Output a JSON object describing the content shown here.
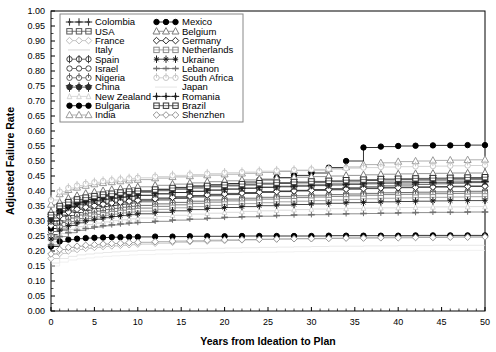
{
  "chart_data": {
    "type": "line",
    "title": "",
    "xlabel": "Years from Ideation to Plan",
    "ylabel": "Adjusted Failure Rate",
    "xlim": [
      0,
      50
    ],
    "ylim": [
      0.0,
      1.0
    ],
    "xticks": [
      0,
      5,
      10,
      15,
      20,
      25,
      30,
      35,
      40,
      45,
      50
    ],
    "yticks": [
      0.0,
      0.05,
      0.1,
      0.15,
      0.2,
      0.25,
      0.3,
      0.35,
      0.4,
      0.45,
      0.5,
      0.55,
      0.6,
      0.65,
      0.7,
      0.75,
      0.8,
      0.85,
      0.9,
      0.95,
      1.0
    ],
    "ytick_labels": [
      "0.00",
      "0.05",
      "0.10",
      "0.15",
      "0.20",
      "0.25",
      "0.30",
      "0.35",
      "0.40",
      "0.45",
      "0.50",
      "0.55",
      "0.60",
      "0.65",
      "0.70",
      "0.75",
      "0.80",
      "0.85",
      "0.90",
      "0.95",
      "1.00"
    ],
    "xtick_labels": [
      "0",
      "5",
      "10",
      "15",
      "20",
      "25",
      "30",
      "35",
      "40",
      "45",
      "50"
    ],
    "grid": false,
    "legend_position": "top-left",
    "marker_step_interval": 2,
    "x": [
      0,
      1,
      2,
      3,
      4,
      5,
      6,
      7,
      8,
      9,
      10,
      12,
      14,
      16,
      18,
      20,
      22,
      24,
      26,
      28,
      30,
      32,
      34,
      36,
      38,
      40,
      42,
      44,
      46,
      48,
      50
    ],
    "series": [
      {
        "name": "Colombia",
        "marker": "star4",
        "color": "#3a3a3a",
        "fill": "solid",
        "values": [
          0.255,
          0.3,
          0.318,
          0.328,
          0.336,
          0.342,
          0.348,
          0.352,
          0.356,
          0.36,
          0.364,
          0.37,
          0.375,
          0.38,
          0.384,
          0.388,
          0.392,
          0.396,
          0.399,
          0.402,
          0.405,
          0.408,
          0.411,
          0.414,
          0.417,
          0.42,
          0.422,
          0.424,
          0.426,
          0.428,
          0.43
        ]
      },
      {
        "name": "USA",
        "marker": "square-grid",
        "color": "#555555",
        "fill": "open",
        "values": [
          0.3,
          0.33,
          0.345,
          0.354,
          0.36,
          0.366,
          0.371,
          0.375,
          0.379,
          0.382,
          0.385,
          0.39,
          0.395,
          0.399,
          0.403,
          0.407,
          0.41,
          0.413,
          0.416,
          0.419,
          0.422,
          0.424,
          0.426,
          0.428,
          0.43,
          0.432,
          0.434,
          0.436,
          0.437,
          0.438,
          0.44
        ]
      },
      {
        "name": "France",
        "marker": "diamond",
        "color": "#bbbbbb",
        "fill": "open",
        "values": [
          0.175,
          0.192,
          0.2,
          0.205,
          0.209,
          0.212,
          0.215,
          0.217,
          0.219,
          0.221,
          0.223,
          0.226,
          0.229,
          0.231,
          0.233,
          0.235,
          0.237,
          0.239,
          0.24,
          0.241,
          0.242,
          0.243,
          0.244,
          0.245,
          0.246,
          0.247,
          0.248,
          0.248,
          0.249,
          0.249,
          0.25
        ]
      },
      {
        "name": "Italy",
        "marker": "none",
        "color": "#e2e2e2",
        "fill": "open",
        "values": [
          0.16,
          0.175,
          0.182,
          0.187,
          0.19,
          0.193,
          0.195,
          0.197,
          0.199,
          0.2,
          0.202,
          0.204,
          0.206,
          0.208,
          0.209,
          0.21,
          0.211,
          0.212,
          0.213,
          0.214,
          0.215,
          0.216,
          0.216,
          0.217,
          0.217,
          0.218,
          0.218,
          0.219,
          0.219,
          0.219,
          0.22
        ]
      },
      {
        "name": "Spain",
        "marker": "circle-plus",
        "color": "#404040",
        "fill": "open",
        "values": [
          0.29,
          0.32,
          0.334,
          0.343,
          0.35,
          0.355,
          0.359,
          0.363,
          0.366,
          0.369,
          0.372,
          0.377,
          0.381,
          0.385,
          0.389,
          0.392,
          0.395,
          0.398,
          0.4,
          0.402,
          0.404,
          0.406,
          0.408,
          0.41,
          0.412,
          0.413,
          0.414,
          0.415,
          0.416,
          0.417,
          0.418
        ]
      },
      {
        "name": "Israel",
        "marker": "circle",
        "color": "#4a4a4a",
        "fill": "open",
        "values": [
          0.265,
          0.295,
          0.31,
          0.32,
          0.327,
          0.333,
          0.338,
          0.342,
          0.346,
          0.349,
          0.352,
          0.357,
          0.362,
          0.366,
          0.37,
          0.373,
          0.376,
          0.379,
          0.382,
          0.384,
          0.386,
          0.388,
          0.39,
          0.392,
          0.394,
          0.395,
          0.396,
          0.397,
          0.398,
          0.399,
          0.4
        ]
      },
      {
        "name": "Nigeria",
        "marker": "circle-bar",
        "color": "#606060",
        "fill": "open",
        "values": [
          0.25,
          0.282,
          0.298,
          0.308,
          0.316,
          0.322,
          0.327,
          0.332,
          0.336,
          0.34,
          0.343,
          0.349,
          0.354,
          0.359,
          0.363,
          0.367,
          0.37,
          0.373,
          0.376,
          0.378,
          0.38,
          0.382,
          0.384,
          0.386,
          0.388,
          0.389,
          0.39,
          0.391,
          0.392,
          0.393,
          0.394
        ]
      },
      {
        "name": "China",
        "marker": "circle-cross",
        "color": "#2d2d2d",
        "fill": "solid",
        "values": [
          0.31,
          0.342,
          0.357,
          0.366,
          0.373,
          0.378,
          0.383,
          0.387,
          0.39,
          0.393,
          0.396,
          0.401,
          0.406,
          0.41,
          0.414,
          0.417,
          0.42,
          0.423,
          0.425,
          0.427,
          0.429,
          0.431,
          0.433,
          0.435,
          0.437,
          0.438,
          0.439,
          0.44,
          0.441,
          0.442,
          0.443
        ]
      },
      {
        "name": "New Zealand",
        "marker": "tri-small",
        "color": "#cfcfcf",
        "fill": "open",
        "values": [
          0.23,
          0.258,
          0.272,
          0.281,
          0.288,
          0.293,
          0.297,
          0.301,
          0.304,
          0.307,
          0.31,
          0.315,
          0.319,
          0.323,
          0.326,
          0.329,
          0.332,
          0.334,
          0.336,
          0.338,
          0.34,
          0.341,
          0.342,
          0.343,
          0.344,
          0.345,
          0.346,
          0.347,
          0.347,
          0.348,
          0.348
        ]
      },
      {
        "name": "Bulgaria",
        "marker": "circle",
        "color": "#000000",
        "fill": "solid",
        "values": [
          0.215,
          0.232,
          0.238,
          0.241,
          0.243,
          0.244,
          0.245,
          0.246,
          0.246,
          0.247,
          0.247,
          0.248,
          0.248,
          0.249,
          0.249,
          0.249,
          0.25,
          0.25,
          0.25,
          0.25,
          0.25,
          0.251,
          0.251,
          0.251,
          0.251,
          0.251,
          0.252,
          0.252,
          0.252,
          0.252,
          0.252
        ]
      },
      {
        "name": "India",
        "marker": "triangle",
        "color": "#9a9a9a",
        "fill": "open",
        "values": [
          0.355,
          0.39,
          0.404,
          0.412,
          0.418,
          0.423,
          0.427,
          0.43,
          0.433,
          0.436,
          0.438,
          0.443,
          0.447,
          0.45,
          0.453,
          0.456,
          0.459,
          0.462,
          0.465,
          0.468,
          0.47,
          0.474,
          0.48,
          0.488,
          0.494,
          0.498,
          0.5,
          0.502,
          0.503,
          0.504,
          0.505
        ]
      },
      {
        "name": "Mexico",
        "marker": "circle",
        "color": "#000000",
        "fill": "solid",
        "values": [
          0.275,
          0.33,
          0.35,
          0.362,
          0.371,
          0.378,
          0.384,
          0.389,
          0.393,
          0.397,
          0.4,
          0.406,
          0.412,
          0.417,
          0.421,
          0.425,
          0.43,
          0.437,
          0.445,
          0.452,
          0.46,
          0.478,
          0.5,
          0.545,
          0.548,
          0.55,
          0.551,
          0.552,
          0.552,
          0.553,
          0.553
        ]
      },
      {
        "name": "Belgium",
        "marker": "triangle",
        "color": "#7a7a7a",
        "fill": "open",
        "values": [
          0.33,
          0.362,
          0.376,
          0.385,
          0.392,
          0.397,
          0.401,
          0.405,
          0.408,
          0.411,
          0.414,
          0.419,
          0.423,
          0.427,
          0.431,
          0.434,
          0.437,
          0.44,
          0.443,
          0.446,
          0.448,
          0.45,
          0.452,
          0.454,
          0.456,
          0.457,
          0.458,
          0.459,
          0.46,
          0.46,
          0.461
        ]
      },
      {
        "name": "Germany",
        "marker": "diamond",
        "color": "#2a2a2a",
        "fill": "open",
        "values": [
          0.285,
          0.316,
          0.33,
          0.339,
          0.346,
          0.351,
          0.356,
          0.36,
          0.363,
          0.366,
          0.369,
          0.374,
          0.379,
          0.383,
          0.387,
          0.39,
          0.393,
          0.396,
          0.398,
          0.4,
          0.402,
          0.404,
          0.406,
          0.408,
          0.41,
          0.411,
          0.412,
          0.413,
          0.414,
          0.415,
          0.416
        ]
      },
      {
        "name": "Netherlands",
        "marker": "square-grid",
        "color": "#8a8a8a",
        "fill": "open",
        "values": [
          0.245,
          0.276,
          0.291,
          0.301,
          0.308,
          0.314,
          0.319,
          0.323,
          0.327,
          0.33,
          0.333,
          0.339,
          0.344,
          0.348,
          0.352,
          0.355,
          0.358,
          0.361,
          0.364,
          0.366,
          0.368,
          0.37,
          0.372,
          0.374,
          0.376,
          0.377,
          0.378,
          0.379,
          0.38,
          0.381,
          0.382
        ]
      },
      {
        "name": "Ukraine",
        "marker": "star5",
        "color": "#1a1a1a",
        "fill": "solid",
        "values": [
          0.24,
          0.27,
          0.285,
          0.294,
          0.301,
          0.306,
          0.311,
          0.315,
          0.318,
          0.321,
          0.324,
          0.329,
          0.334,
          0.338,
          0.342,
          0.345,
          0.348,
          0.351,
          0.353,
          0.355,
          0.357,
          0.359,
          0.361,
          0.362,
          0.364,
          0.365,
          0.366,
          0.367,
          0.368,
          0.368,
          0.369
        ]
      },
      {
        "name": "Lebanon",
        "marker": "hbar",
        "color": "#707070",
        "fill": "solid",
        "values": [
          0.22,
          0.248,
          0.261,
          0.269,
          0.275,
          0.28,
          0.284,
          0.287,
          0.29,
          0.293,
          0.295,
          0.299,
          0.303,
          0.306,
          0.309,
          0.312,
          0.314,
          0.316,
          0.318,
          0.32,
          0.321,
          0.323,
          0.324,
          0.325,
          0.326,
          0.327,
          0.328,
          0.329,
          0.329,
          0.33,
          0.33
        ]
      },
      {
        "name": "South Africa",
        "marker": "circle-bar",
        "color": "#c8c8c8",
        "fill": "open",
        "values": [
          0.37,
          0.398,
          0.41,
          0.418,
          0.424,
          0.429,
          0.433,
          0.436,
          0.439,
          0.442,
          0.444,
          0.448,
          0.452,
          0.455,
          0.458,
          0.461,
          0.463,
          0.466,
          0.468,
          0.47,
          0.472,
          0.474,
          0.476,
          0.478,
          0.48,
          0.481,
          0.482,
          0.483,
          0.484,
          0.485,
          0.486
        ]
      },
      {
        "name": "Japan",
        "marker": "none",
        "color": "#ededed",
        "fill": "open",
        "values": [
          0.15,
          0.163,
          0.17,
          0.174,
          0.177,
          0.18,
          0.182,
          0.184,
          0.185,
          0.187,
          0.188,
          0.19,
          0.191,
          0.193,
          0.194,
          0.195,
          0.196,
          0.196,
          0.197,
          0.198,
          0.198,
          0.199,
          0.199,
          0.2,
          0.2,
          0.2,
          0.201,
          0.201,
          0.201,
          0.202,
          0.202
        ]
      },
      {
        "name": "Romania",
        "marker": "star4",
        "color": "#202020",
        "fill": "solid",
        "values": [
          0.3,
          0.334,
          0.348,
          0.357,
          0.364,
          0.369,
          0.373,
          0.377,
          0.38,
          0.383,
          0.386,
          0.391,
          0.395,
          0.399,
          0.403,
          0.406,
          0.409,
          0.412,
          0.414,
          0.416,
          0.418,
          0.42,
          0.422,
          0.424,
          0.426,
          0.427,
          0.428,
          0.429,
          0.43,
          0.431,
          0.432
        ]
      },
      {
        "name": "Brazil",
        "marker": "square-grid",
        "color": "#333333",
        "fill": "open",
        "values": [
          0.32,
          0.35,
          0.363,
          0.372,
          0.378,
          0.383,
          0.388,
          0.391,
          0.395,
          0.398,
          0.4,
          0.405,
          0.41,
          0.414,
          0.417,
          0.42,
          0.423,
          0.426,
          0.428,
          0.43,
          0.432,
          0.434,
          0.436,
          0.438,
          0.44,
          0.441,
          0.442,
          0.443,
          0.444,
          0.445,
          0.446
        ]
      },
      {
        "name": "Shenzhen",
        "marker": "diamond",
        "color": "#959595",
        "fill": "open",
        "values": [
          0.19,
          0.205,
          0.212,
          0.216,
          0.219,
          0.221,
          0.223,
          0.225,
          0.226,
          0.228,
          0.229,
          0.231,
          0.233,
          0.234,
          0.236,
          0.237,
          0.238,
          0.239,
          0.24,
          0.241,
          0.241,
          0.242,
          0.243,
          0.243,
          0.244,
          0.244,
          0.245,
          0.245,
          0.246,
          0.246,
          0.247
        ]
      }
    ]
  },
  "legend": {
    "column1": [
      {
        "label": "Colombia"
      },
      {
        "label": "USA"
      },
      {
        "label": "France"
      },
      {
        "label": "Italy"
      },
      {
        "label": "Spain"
      },
      {
        "label": "Israel"
      },
      {
        "label": "Nigeria"
      },
      {
        "label": "China"
      },
      {
        "label": "New Zealand"
      },
      {
        "label": "Bulgaria"
      },
      {
        "label": "India"
      }
    ],
    "column2": [
      {
        "label": "Mexico"
      },
      {
        "label": "Belgium"
      },
      {
        "label": "Germany"
      },
      {
        "label": "Netherlands"
      },
      {
        "label": "Ukraine"
      },
      {
        "label": "Lebanon"
      },
      {
        "label": "South Africa"
      },
      {
        "label": "Japan"
      },
      {
        "label": "Romania"
      },
      {
        "label": "Brazil"
      },
      {
        "label": "Shenzhen"
      }
    ]
  }
}
